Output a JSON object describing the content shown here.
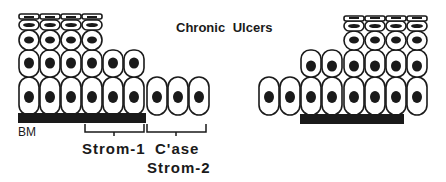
{
  "title": "Chronic  Ulcers",
  "labels": {
    "basement_membrane": "BM",
    "strom1": "Strom-1",
    "case": "C'ase",
    "strom2": "Strom-2"
  },
  "colors": {
    "ink": "#1a1a1a",
    "background": "#ffffff"
  },
  "left_epithelium": {
    "basal_row_cells": 9,
    "basal_row_on_bm": 6,
    "suprabasal_row_cells": 6,
    "spinous_row_cells": 4,
    "granular_row_cells": 4,
    "squame_row_cells": 4
  },
  "right_epithelium": {
    "basal_row_cells": 8,
    "basal_row_on_bm": 6,
    "suprabasal_row_cells": 6,
    "spinous_row_cells": 4,
    "granular_row_cells": 4,
    "squame_row_cells": 4
  }
}
